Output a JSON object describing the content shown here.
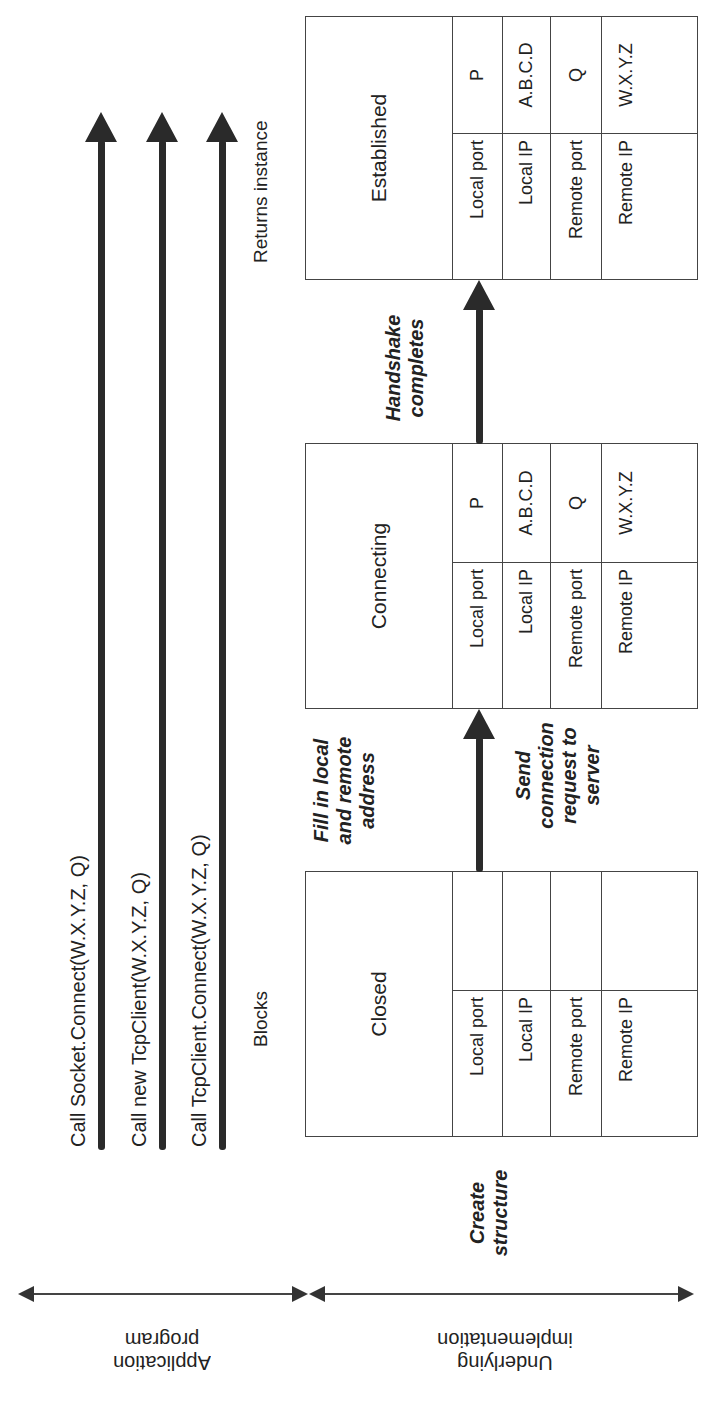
{
  "application_calls": [
    {
      "label": "Call Socket.Connect(W.X.Y.Z, Q)"
    },
    {
      "label": "Call new TcpClient(W.X.Y.Z, Q)"
    },
    {
      "label": "Call TcpClient.Connect(W.X.Y.Z, Q)"
    }
  ],
  "notes": {
    "blocks": "Blocks",
    "returns": "Returns instance"
  },
  "states": [
    {
      "name": "Closed",
      "fields": [
        {
          "label": "Local port",
          "value": ""
        },
        {
          "label": "Local IP",
          "value": ""
        },
        {
          "label": "Remote port",
          "value": ""
        },
        {
          "label": "Remote IP",
          "value": ""
        }
      ]
    },
    {
      "name": "Connecting",
      "fields": [
        {
          "label": "Local port",
          "value": "P"
        },
        {
          "label": "Local IP",
          "value": "A.B.C.D"
        },
        {
          "label": "Remote port",
          "value": "Q"
        },
        {
          "label": "Remote IP",
          "value": "W.X.Y.Z"
        }
      ]
    },
    {
      "name": "Established",
      "fields": [
        {
          "label": "Local port",
          "value": "P"
        },
        {
          "label": "Local IP",
          "value": "A.B.C.D"
        },
        {
          "label": "Remote port",
          "value": "Q"
        },
        {
          "label": "Remote IP",
          "value": "W.X.Y.Z"
        }
      ]
    }
  ],
  "actions": {
    "create": "Create structure",
    "fill": "Fill in local and remote address",
    "send": "Send connection request to server",
    "handshake": "Handshake completes"
  },
  "layers": {
    "application": "Application program",
    "underlying": "Underlying implementation"
  },
  "colors": {
    "line": "#2a2a2a",
    "border": "#444444",
    "background": "#ffffff"
  }
}
